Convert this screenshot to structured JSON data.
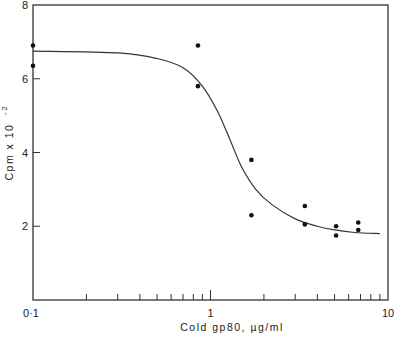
{
  "chart_data": {
    "type": "scatter",
    "title": "",
    "xlabel": "Cold gp80, µg/ml",
    "ylabel": "Cpm x 10⁻²",
    "ylabel_main": "Cpm x 10",
    "ylabel_exp": "-2",
    "xscale": "log",
    "xlim": [
      0.1,
      10
    ],
    "ylim": [
      0,
      8
    ],
    "x_tick_labels": [
      "0·1",
      "1",
      "10"
    ],
    "y_tick_labels": [
      "2",
      "4",
      "6",
      "8"
    ],
    "y_ticks": [
      2,
      4,
      6,
      8
    ],
    "grid": false,
    "legend": null,
    "series": [
      {
        "name": "data points",
        "type": "scatter",
        "points": [
          {
            "x": 0.1,
            "y": 6.9
          },
          {
            "x": 0.1,
            "y": 6.35
          },
          {
            "x": 0.85,
            "y": 6.9
          },
          {
            "x": 0.85,
            "y": 5.8
          },
          {
            "x": 1.7,
            "y": 3.8
          },
          {
            "x": 1.7,
            "y": 2.3
          },
          {
            "x": 3.4,
            "y": 2.55
          },
          {
            "x": 3.4,
            "y": 2.05
          },
          {
            "x": 5.1,
            "y": 2.0
          },
          {
            "x": 5.1,
            "y": 1.75
          },
          {
            "x": 6.8,
            "y": 2.1
          },
          {
            "x": 6.8,
            "y": 1.9
          }
        ]
      },
      {
        "name": "fitted curve",
        "type": "line",
        "points": [
          {
            "x": 0.1,
            "y": 6.75
          },
          {
            "x": 0.3,
            "y": 6.7
          },
          {
            "x": 0.5,
            "y": 6.55
          },
          {
            "x": 0.7,
            "y": 6.3
          },
          {
            "x": 0.9,
            "y": 5.8
          },
          {
            "x": 1.1,
            "y": 5.1
          },
          {
            "x": 1.3,
            "y": 4.3
          },
          {
            "x": 1.5,
            "y": 3.6
          },
          {
            "x": 1.8,
            "y": 3.0
          },
          {
            "x": 2.2,
            "y": 2.6
          },
          {
            "x": 3.0,
            "y": 2.2
          },
          {
            "x": 4.0,
            "y": 2.0
          },
          {
            "x": 5.0,
            "y": 1.9
          },
          {
            "x": 6.5,
            "y": 1.83
          },
          {
            "x": 9.0,
            "y": 1.8
          }
        ]
      }
    ]
  }
}
